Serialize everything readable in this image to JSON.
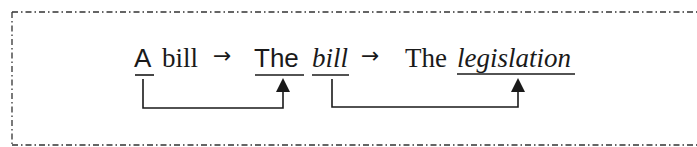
{
  "diagram": {
    "tokens": [
      {
        "id": "a",
        "text": "A",
        "style": "sans",
        "underlined": true
      },
      {
        "id": "bill1",
        "text": "bill",
        "style": "serif",
        "underlined": false
      },
      {
        "id": "arrow1",
        "text": "→"
      },
      {
        "id": "the1",
        "text": "The",
        "style": "sans",
        "underlined": true
      },
      {
        "id": "bill2",
        "text": "bill",
        "style": "serif-italic",
        "underlined": true
      },
      {
        "id": "arrow2",
        "text": "→"
      },
      {
        "id": "the2",
        "text": "The",
        "style": "serif",
        "underlined": false
      },
      {
        "id": "legislation",
        "text": "legislation",
        "style": "serif-italic",
        "underlined": true
      }
    ],
    "links": [
      {
        "from": "A",
        "to": "The"
      },
      {
        "from": "bill",
        "to": "legislation"
      }
    ],
    "colors": {
      "ink": "#1a1a1a",
      "border": "#333333",
      "background": "#ffffff"
    }
  }
}
